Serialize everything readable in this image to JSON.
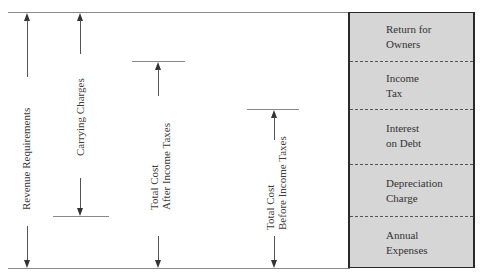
{
  "diagram": {
    "dimensions": [
      {
        "id": "revenue-requirements",
        "label_lines": [
          "Revenue Requirements"
        ],
        "top_y": 12,
        "bottom_y": 268
      },
      {
        "id": "carrying-charges",
        "label_lines": [
          "Carrying Charges"
        ],
        "top_y": 12,
        "bottom_y": 216
      },
      {
        "id": "total-cost-after-taxes",
        "label_lines": [
          "Total Cost",
          "After Income Taxes"
        ],
        "top_y": 61,
        "bottom_y": 268
      },
      {
        "id": "total-cost-before-taxes",
        "label_lines": [
          "Total Cost",
          "Before Income Taxes"
        ],
        "top_y": 109,
        "bottom_y": 268
      }
    ],
    "stack": {
      "fill_color": "#d6d6d6",
      "border_color": "#2a2a2a",
      "segments": [
        {
          "label_lines": [
            "Return for",
            "Owners"
          ]
        },
        {
          "label_lines": [
            "Income",
            "Tax"
          ]
        },
        {
          "label_lines": [
            "Interest",
            "on Debt"
          ]
        },
        {
          "label_lines": [
            "Depreciation",
            "Charge"
          ]
        },
        {
          "label_lines": [
            "Annual",
            "Expenses"
          ]
        }
      ]
    }
  }
}
